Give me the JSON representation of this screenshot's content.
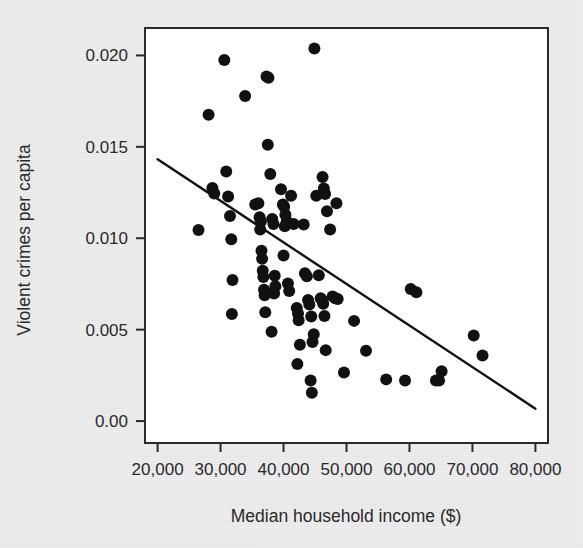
{
  "chart_data": {
    "type": "scatter",
    "title": "",
    "xlabel": "Median household income ($)",
    "ylabel": "Violent crimes per capita",
    "xlim": [
      18000,
      82000
    ],
    "ylim": [
      -0.0012,
      0.0215
    ],
    "xticks": [
      20000,
      30000,
      40000,
      50000,
      60000,
      70000,
      80000
    ],
    "xtick_labels": [
      "20,000",
      "30,000",
      "40,000",
      "50,000",
      "60,000",
      "70,000",
      "80,000"
    ],
    "yticks": [
      0.0,
      0.005,
      0.01,
      0.015,
      0.02
    ],
    "ytick_labels": [
      "0.00",
      "0.005",
      "0.010",
      "0.015",
      "0.020"
    ],
    "grid": false,
    "legend": "none",
    "marker_color": "#111111",
    "marker_size": 7.6,
    "frame_color": "#2b2b2b",
    "plot_background": "#ffffff",
    "figure_background": "#e9e9e9",
    "trendline": {
      "type": "linear-regression",
      "color": "#111111",
      "width": 2.4,
      "x_start": 20000,
      "y_start": 0.01432,
      "x_end": 80000,
      "y_end": 0.00068
    },
    "points": [
      {
        "x": 26500,
        "y": 0.01045
      },
      {
        "x": 28100,
        "y": 0.01675
      },
      {
        "x": 28700,
        "y": 0.01275
      },
      {
        "x": 29000,
        "y": 0.01245
      },
      {
        "x": 30600,
        "y": 0.01975
      },
      {
        "x": 30900,
        "y": 0.01365
      },
      {
        "x": 31200,
        "y": 0.01228
      },
      {
        "x": 31500,
        "y": 0.01122
      },
      {
        "x": 31700,
        "y": 0.00995
      },
      {
        "x": 31900,
        "y": 0.00772
      },
      {
        "x": 31800,
        "y": 0.00585
      },
      {
        "x": 33900,
        "y": 0.01778
      },
      {
        "x": 35500,
        "y": 0.01185
      },
      {
        "x": 36000,
        "y": 0.01192
      },
      {
        "x": 36200,
        "y": 0.01115
      },
      {
        "x": 36400,
        "y": 0.01092
      },
      {
        "x": 36300,
        "y": 0.01048
      },
      {
        "x": 36500,
        "y": 0.00932
      },
      {
        "x": 36600,
        "y": 0.00888
      },
      {
        "x": 36700,
        "y": 0.00822
      },
      {
        "x": 36800,
        "y": 0.00788
      },
      {
        "x": 36900,
        "y": 0.00718
      },
      {
        "x": 37000,
        "y": 0.00688
      },
      {
        "x": 37100,
        "y": 0.00595
      },
      {
        "x": 37300,
        "y": 0.01885
      },
      {
        "x": 37600,
        "y": 0.01878
      },
      {
        "x": 37500,
        "y": 0.01512
      },
      {
        "x": 37900,
        "y": 0.01352
      },
      {
        "x": 38200,
        "y": 0.01105
      },
      {
        "x": 38400,
        "y": 0.01078
      },
      {
        "x": 38600,
        "y": 0.00795
      },
      {
        "x": 38700,
        "y": 0.00738
      },
      {
        "x": 38500,
        "y": 0.00698
      },
      {
        "x": 38100,
        "y": 0.00488
      },
      {
        "x": 39600,
        "y": 0.01268
      },
      {
        "x": 39900,
        "y": 0.01185
      },
      {
        "x": 40100,
        "y": 0.01172
      },
      {
        "x": 40300,
        "y": 0.01128
      },
      {
        "x": 40500,
        "y": 0.01092
      },
      {
        "x": 40200,
        "y": 0.01065
      },
      {
        "x": 40000,
        "y": 0.00905
      },
      {
        "x": 40700,
        "y": 0.00752
      },
      {
        "x": 40900,
        "y": 0.00712
      },
      {
        "x": 41200,
        "y": 0.01232
      },
      {
        "x": 41600,
        "y": 0.01078
      },
      {
        "x": 42100,
        "y": 0.00618
      },
      {
        "x": 42300,
        "y": 0.00588
      },
      {
        "x": 42400,
        "y": 0.00552
      },
      {
        "x": 42600,
        "y": 0.00418
      },
      {
        "x": 42200,
        "y": 0.00312
      },
      {
        "x": 43200,
        "y": 0.01075
      },
      {
        "x": 43400,
        "y": 0.00808
      },
      {
        "x": 43700,
        "y": 0.00792
      },
      {
        "x": 43900,
        "y": 0.00662
      },
      {
        "x": 44100,
        "y": 0.00638
      },
      {
        "x": 44400,
        "y": 0.00572
      },
      {
        "x": 44600,
        "y": 0.00432
      },
      {
        "x": 44800,
        "y": 0.00475
      },
      {
        "x": 44300,
        "y": 0.00222
      },
      {
        "x": 44500,
        "y": 0.00155
      },
      {
        "x": 44900,
        "y": 0.02038
      },
      {
        "x": 45200,
        "y": 0.01232
      },
      {
        "x": 45600,
        "y": 0.00798
      },
      {
        "x": 45900,
        "y": 0.00672
      },
      {
        "x": 46100,
        "y": 0.00662
      },
      {
        "x": 46300,
        "y": 0.00642
      },
      {
        "x": 46500,
        "y": 0.00575
      },
      {
        "x": 46700,
        "y": 0.00388
      },
      {
        "x": 46200,
        "y": 0.01335
      },
      {
        "x": 46400,
        "y": 0.01272
      },
      {
        "x": 46600,
        "y": 0.01242
      },
      {
        "x": 46900,
        "y": 0.01148
      },
      {
        "x": 47400,
        "y": 0.01048
      },
      {
        "x": 47800,
        "y": 0.00682
      },
      {
        "x": 48200,
        "y": 0.00672
      },
      {
        "x": 48600,
        "y": 0.00668
      },
      {
        "x": 48400,
        "y": 0.01192
      },
      {
        "x": 49600,
        "y": 0.00265
      },
      {
        "x": 51200,
        "y": 0.00548
      },
      {
        "x": 53100,
        "y": 0.00385
      },
      {
        "x": 56300,
        "y": 0.00228
      },
      {
        "x": 59300,
        "y": 0.00222
      },
      {
        "x": 60200,
        "y": 0.00722
      },
      {
        "x": 61100,
        "y": 0.00705
      },
      {
        "x": 64200,
        "y": 0.00222
      },
      {
        "x": 64700,
        "y": 0.00222
      },
      {
        "x": 65100,
        "y": 0.00272
      },
      {
        "x": 70200,
        "y": 0.00468
      },
      {
        "x": 71600,
        "y": 0.00358
      }
    ]
  }
}
